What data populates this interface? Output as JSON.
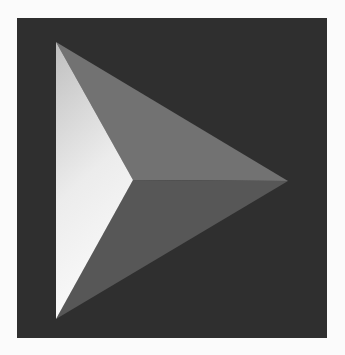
{
  "logo": {
    "icon": "faceted-play-arrow-icon",
    "colors": {
      "page_background": "#fbfbfb",
      "tile_background": "#2f2f2f",
      "top_facet": "#727272",
      "bottom_facet": "#575757",
      "left_facet_light_top": "#bfbfbf",
      "left_facet_light_bottom": "#fafafa"
    }
  }
}
